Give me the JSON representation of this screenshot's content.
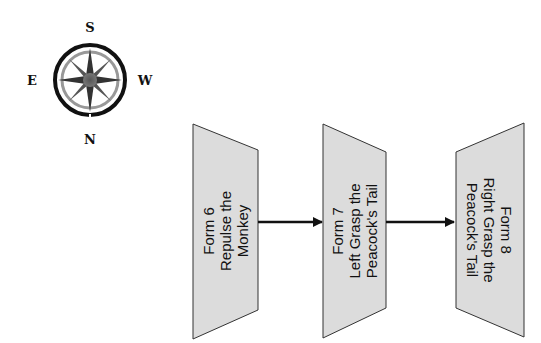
{
  "compass": {
    "top_label": "S",
    "bottom_label": "N",
    "left_label": "E",
    "right_label": "W"
  },
  "forms": [
    {
      "lines": [
        "Form 6",
        "Repulse the",
        "Monkey"
      ],
      "orientation": "rotated-ccw"
    },
    {
      "lines": [
        "Form 7",
        "Left Grasp the",
        "Peacock's Tail"
      ],
      "orientation": "rotated-ccw"
    },
    {
      "lines": [
        "Form 8",
        "Right Grasp the",
        "Peacock's Tail"
      ],
      "orientation": "rotated-cw"
    }
  ],
  "colors": {
    "shape_fill": "#dcdcdc",
    "stroke": "#222222"
  }
}
